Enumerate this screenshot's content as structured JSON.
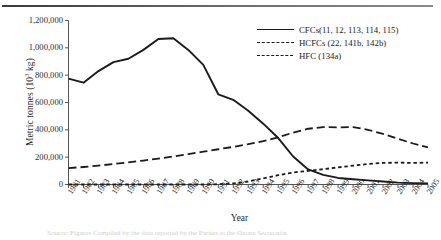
{
  "figure": {
    "ylabel_text": "Metric tonnes (10",
    "ylabel_sup": "3",
    "ylabel_tail": " kg)",
    "ylabel_full": "Metric tonnes (10³ kg)",
    "xlabel": "Year",
    "caption": "Source: Figures Compiled by the data reported by the Parties to the Ozone Secretariat"
  },
  "legend": {
    "position": "top-right",
    "items": [
      {
        "label": "CFCs(11, 12, 113, 114, 115)",
        "style": "solid",
        "key": "legend-key-cfcs"
      },
      {
        "label": "HCFCs (22, 141b, 142b)",
        "style": "long-dash",
        "key": "legend-key-hcfcs"
      },
      {
        "label": "HFC (134a)",
        "style": "short-dash",
        "key": "legend-key-hfc"
      }
    ]
  },
  "chart_data": {
    "type": "line",
    "title": "",
    "subtitle": "",
    "xlabel": "Year",
    "ylabel": "Metric tonnes (10³ kg)",
    "xlim": [
      1981,
      2005
    ],
    "ylim": [
      0,
      1200000
    ],
    "ytick_values": [
      0,
      200000,
      400000,
      600000,
      800000,
      1000000,
      1200000
    ],
    "ytick_labels": [
      "0",
      "200,000",
      "400,000",
      "600,000",
      "800,000",
      "1,000,000",
      "1,200,000"
    ],
    "grid": false,
    "legend_position": "top-right",
    "categories": [
      1981,
      1982,
      1983,
      1984,
      1985,
      1986,
      1987,
      1988,
      1989,
      1990,
      1991,
      1992,
      1993,
      1994,
      1995,
      1996,
      1997,
      1998,
      1999,
      2000,
      2001,
      2002,
      2003,
      2004,
      2005
    ],
    "xtick_labels": [
      "1981",
      "1982",
      "1983",
      "1984",
      "1985",
      "1986",
      "1987",
      "1988",
      "1989",
      "1990",
      "1991",
      "1992",
      "1993",
      "1994",
      "1995",
      "1996",
      "1997",
      "1998",
      "1999",
      "2000",
      "2001",
      "2002",
      "2003",
      "2004",
      "2005"
    ],
    "series": [
      {
        "name": "CFCs(11, 12, 113, 114, 115)",
        "style": "solid",
        "color": "#1b1b1b",
        "values": [
          775000,
          745000,
          830000,
          895000,
          920000,
          985000,
          1065000,
          1070000,
          985000,
          875000,
          660000,
          620000,
          540000,
          445000,
          340000,
          205000,
          110000,
          70000,
          48000,
          38000,
          30000,
          22000,
          14000,
          10000,
          8000
        ]
      },
      {
        "name": "HCFCs (22, 141b, 142b)",
        "style": "long-dash",
        "color": "#1b1b1b",
        "values": [
          120000,
          128000,
          138000,
          150000,
          162000,
          175000,
          190000,
          205000,
          222000,
          240000,
          258000,
          275000,
          295000,
          318000,
          345000,
          380000,
          408000,
          420000,
          418000,
          420000,
          400000,
          370000,
          335000,
          300000,
          272000
        ]
      },
      {
        "name": "HFC (134a)",
        "style": "short-dash",
        "color": "#1b1b1b",
        "values": [
          0,
          0,
          0,
          0,
          0,
          0,
          0,
          0,
          0,
          0,
          2000,
          8000,
          22000,
          45000,
          68000,
          88000,
          100000,
          112000,
          125000,
          138000,
          150000,
          158000,
          160000,
          158000,
          160000
        ]
      }
    ]
  }
}
